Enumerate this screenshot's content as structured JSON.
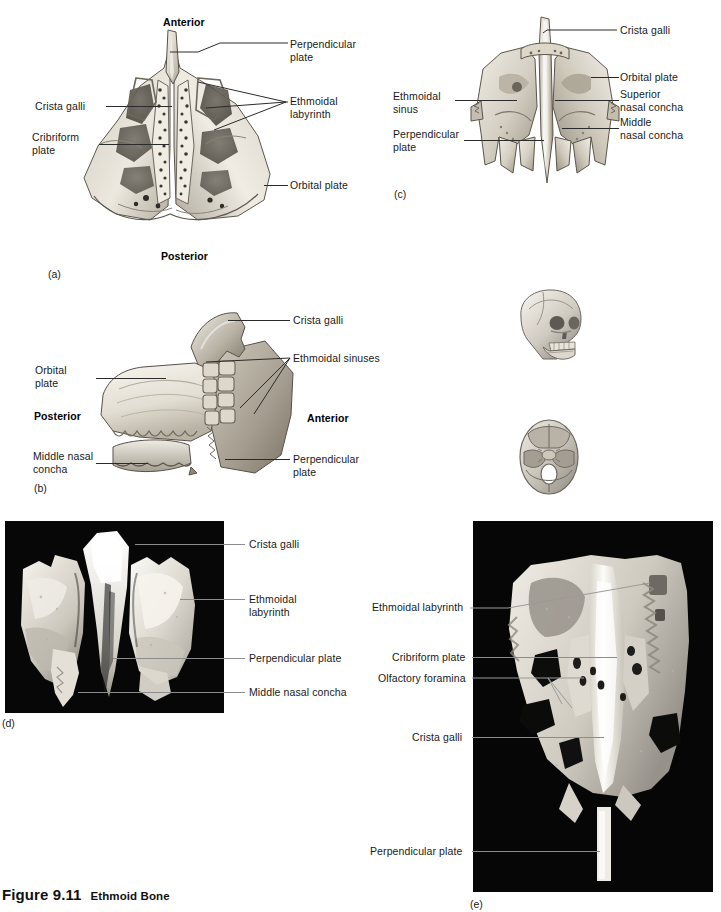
{
  "figure": {
    "number": "Figure 9.11",
    "title": "Ethmoid Bone"
  },
  "panels": [
    {
      "id": "(a)",
      "key": "a",
      "view": "superior view of ethmoid bone, illustration",
      "orientation_labels": [
        {
          "text": "Anterior",
          "bold": true
        },
        {
          "text": "Posterior",
          "bold": true
        }
      ],
      "labels": [
        "Perpendicular\nplate",
        "Crista galli",
        "Cribriform\nplate",
        "Ethmoidal\nlabyrinth",
        "Orbital plate"
      ]
    },
    {
      "id": "(c)",
      "key": "c",
      "view": "anterior view of ethmoid bone, illustration",
      "labels": [
        "Crista galli",
        "Orbital plate",
        "Superior\nnasal concha",
        "Middle\nnasal concha",
        "Ethmoidal\nsinus",
        "Perpendicular\nplate"
      ]
    },
    {
      "id": "(b)",
      "key": "b",
      "view": "lateral view of ethmoid bone, illustration",
      "orientation_labels": [
        {
          "text": "Posterior",
          "bold": true
        },
        {
          "text": "Anterior",
          "bold": true
        }
      ],
      "labels": [
        "Crista galli",
        "Ethmoidal sinuses",
        "Orbital\nplate",
        "Middle nasal\nconcha",
        "Perpendicular\nplate"
      ]
    },
    {
      "id": "(d)",
      "key": "d",
      "view": "anterior photograph of ethmoid bone",
      "labels": [
        "Crista galli",
        "Ethmoidal\nlabyrinth",
        "Perpendicular plate",
        "Middle nasal concha"
      ]
    },
    {
      "id": "(e)",
      "key": "e",
      "view": "superior photograph of ethmoid bone",
      "labels": [
        "Ethmoidal labyrinth",
        "Cribriform plate",
        "Olfactory foramina",
        "Crista galli",
        "Perpendicular plate"
      ]
    }
  ],
  "panel_a": {
    "id": "(a)",
    "anterior": "Anterior",
    "posterior": "Posterior",
    "perpendicular_plate": "Perpendicular\nplate",
    "crista_galli": "Crista galli",
    "cribriform_plate": "Cribriform\nplate",
    "ethmoidal_labyrinth": "Ethmoidal\nlabyrinth",
    "orbital_plate": "Orbital plate"
  },
  "panel_b": {
    "id": "(b)",
    "crista_galli": "Crista galli",
    "ethmoidal_sinuses": "Ethmoidal sinuses",
    "orbital_plate": "Orbital\nplate",
    "posterior": "Posterior",
    "anterior": "Anterior",
    "middle_nasal_concha": "Middle nasal\nconcha",
    "perpendicular_plate": "Perpendicular\nplate"
  },
  "panel_c": {
    "id": "(c)",
    "crista_galli": "Crista galli",
    "orbital_plate": "Orbital plate",
    "superior_nasal_concha": "Superior\nnasal concha",
    "middle_nasal_concha": "Middle\nnasal concha",
    "ethmoidal_sinus": "Ethmoidal\nsinus",
    "perpendicular_plate": "Perpendicular\nplate"
  },
  "panel_d": {
    "id": "(d)",
    "crista_galli": "Crista galli",
    "ethmoidal_labyrinth": "Ethmoidal\nlabyrinth",
    "perpendicular_plate": "Perpendicular plate",
    "middle_nasal_concha": "Middle nasal concha"
  },
  "panel_e": {
    "id": "(e)",
    "ethmoidal_labyrinth": "Ethmoidal labyrinth",
    "cribriform_plate": "Cribriform plate",
    "olfactory_foramina": "Olfactory foramina",
    "crista_galli": "Crista galli",
    "perpendicular_plate": "Perpendicular plate"
  },
  "orientation_icons": [
    {
      "name": "skull-lateral-oblique-icon",
      "description": "small skull shown in anterolateral view"
    },
    {
      "name": "cranial-floor-superior-icon",
      "description": "small cranial floor shown from above"
    }
  ],
  "colors": {
    "page_background": "#ffffff",
    "text": "#1a1a1a",
    "leader_line": "#2b2b2b",
    "photo_leader_line": "#9a9a9a",
    "photo_background": "#050505",
    "bone_light": "#f2efe8",
    "bone_mid": "#cdc7bb",
    "bone_shadow": "#8e887c"
  }
}
